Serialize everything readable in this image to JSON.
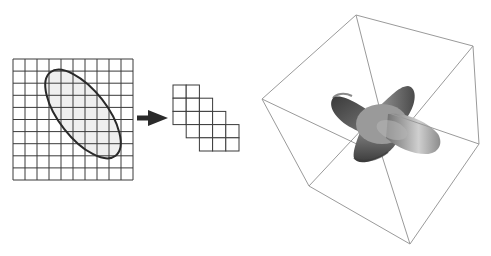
{
  "figure": {
    "colors": {
      "background": "#ffffff",
      "grid_line": "#3a3a3a",
      "ellipse_stroke": "#2a2a2a",
      "ellipse_fill": "#efefef",
      "arrow": "#2a2a2a",
      "cube_line": "#9a9a9a",
      "shape_dark": "#3c3c3c",
      "shape_mid": "#8a8a8a",
      "shape_light": "#c8c8c8"
    },
    "left_panel": {
      "grid": {
        "x": 13,
        "y": 59,
        "cols": 10,
        "rows": 10,
        "cell_w": 12,
        "cell_h": 12.1
      },
      "ellipse": {
        "cx": 83,
        "cy": 114,
        "rx": 53,
        "ry": 24,
        "rotation_deg": 52
      }
    },
    "arrow": {
      "x1": 137,
      "y1": 118,
      "x2": 167,
      "y2": 118
    },
    "middle_panel": {
      "origin_x": 173,
      "origin_y": 85,
      "cell": 13.2,
      "cells": [
        [
          0,
          0
        ],
        [
          1,
          0
        ],
        [
          0,
          1
        ],
        [
          1,
          1
        ],
        [
          2,
          1
        ],
        [
          0,
          2
        ],
        [
          1,
          2
        ],
        [
          2,
          2
        ],
        [
          3,
          2
        ],
        [
          1,
          3
        ],
        [
          2,
          3
        ],
        [
          3,
          3
        ],
        [
          4,
          3
        ],
        [
          2,
          4
        ],
        [
          3,
          4
        ],
        [
          4,
          4
        ]
      ]
    },
    "right_panel": {
      "cube_vertices": {
        "top": [
          356,
          15
        ],
        "right_top": [
          473,
          46
        ],
        "right_bottom": [
          479,
          144
        ],
        "bottom": [
          410,
          244
        ],
        "bottom_left": [
          309,
          186
        ],
        "left": [
          262,
          99
        ],
        "inner_front": [
          380,
          110
        ],
        "inner_back": [
          382,
          156
        ]
      },
      "shape": "3D voxelized cross / four-armed blob"
    }
  }
}
